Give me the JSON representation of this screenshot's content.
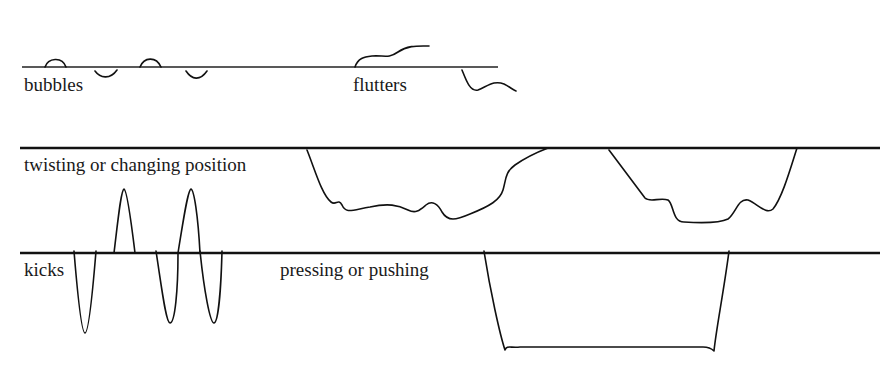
{
  "diagram": {
    "labels": {
      "bubbles": "bubbles",
      "flutters": "flutters",
      "twisting": "twisting or changing position",
      "kicks": "kicks",
      "pressing": "pressing or pushing"
    },
    "colors": {
      "line": "#111111",
      "background": "#ffffff"
    },
    "baselines": [
      {
        "name": "baseline-1",
        "y": 67,
        "x1": 22,
        "x2": 498,
        "weight": "thin"
      },
      {
        "name": "baseline-2",
        "y": 148,
        "x1": 20,
        "x2": 880,
        "weight": "thick"
      },
      {
        "name": "baseline-3",
        "y": 253,
        "x1": 20,
        "x2": 880,
        "weight": "thick"
      }
    ]
  }
}
